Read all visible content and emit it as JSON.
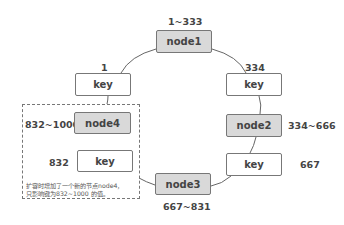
{
  "diagram": {
    "nodes": [
      {
        "id": "node1",
        "label": "node1",
        "range": "1~333"
      },
      {
        "id": "node2",
        "label": "node2",
        "range": "334~666"
      },
      {
        "id": "node3",
        "label": "node3",
        "range": "667~831"
      },
      {
        "id": "node4",
        "label": "node4",
        "range": "832~1000"
      }
    ],
    "keys": [
      {
        "label": "key",
        "value": "1"
      },
      {
        "label": "key",
        "value": "334"
      },
      {
        "label": "key",
        "value": "667"
      },
      {
        "label": "key",
        "value": "832"
      }
    ],
    "note_line1": "扩容时增加了一个新的节点node4，",
    "note_line2": "只影响键为832~1000 的值。",
    "colors": {
      "node_fill": "#d9d9d9",
      "key_fill": "#ffffff",
      "stroke": "#777777"
    }
  }
}
